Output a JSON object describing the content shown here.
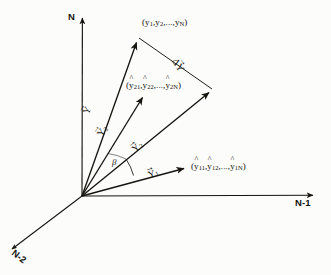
{
  "figure": {
    "kind": "vector-space-geometry-diagram",
    "style": "hand-drawn line art, black ink on off-white paper"
  },
  "axes": [
    {
      "id": "n",
      "label": "N",
      "direction": "vertical-up",
      "tip": [
        82,
        14
      ]
    },
    {
      "id": "n1",
      "label": "N-1",
      "direction": "horizontal-right",
      "tip": [
        318,
        196
      ]
    },
    {
      "id": "n2",
      "label": "N-2",
      "direction": "diagonal-down-left",
      "tip": [
        8,
        252
      ]
    }
  ],
  "origin": {
    "x": 82,
    "y": 196
  },
  "points": [
    {
      "id": "observed",
      "text_main": "(y",
      "parts": [
        {
          "t": "(",
          "sub": ""
        },
        {
          "t": "y",
          "sub": "1"
        },
        {
          "t": ", y",
          "sub": "2"
        },
        {
          "t": ",..., y",
          "sub": "N"
        },
        {
          "t": ")",
          "sub": ""
        }
      ],
      "label": "(y1, y2,..., yN)",
      "x": 138,
      "y": 37
    },
    {
      "id": "fitted2",
      "label": "(y21, y22,..., y2N)",
      "x": 145,
      "y": 92
    },
    {
      "id": "fitted1",
      "label": "(y11, y12,..., y1N)",
      "x": 190,
      "y": 167
    }
  ],
  "labels": {
    "point_observed": {
      "open": "(",
      "y1": "y",
      "y1_sub": "1",
      "y2": "y",
      "y2_sub": "2",
      "yn": "y",
      "yn_sub": "N",
      "sep": ",",
      "ellipsis": ",...,",
      "close": ")"
    },
    "point_fitted2": {
      "open": "(",
      "a": "y",
      "a_sub": "21",
      "b": "y",
      "b_sub": "22",
      "c": "y",
      "c_sub": "2N",
      "sep": ",",
      "ellipsis": ",...,",
      "close": ")"
    },
    "point_fitted1": {
      "open": "(",
      "a": "y",
      "a_sub": "11",
      "b": "y",
      "b_sub": "12",
      "c": "y",
      "c_sub": "1N",
      "sep": ",",
      "ellipsis": ",...,",
      "close": ")"
    },
    "axis_n": "N",
    "axis_n1": "N-1",
    "axis_n2": "N-2",
    "angle_beta": "β"
  },
  "vectors": [
    {
      "id": "Y",
      "symbol": "Y",
      "accent": "arrow",
      "accent_glyph": "→",
      "from": [
        82,
        196
      ],
      "to": [
        138,
        37
      ],
      "label_at": [
        93,
        103
      ],
      "description": "vector to observed response point"
    },
    {
      "id": "Yhat2",
      "symbol": "Y",
      "accent": "hat-arrow",
      "accent_glyph": "→",
      "subscript": "2",
      "from": [
        82,
        196
      ],
      "to": [
        145,
        92
      ],
      "label_at": [
        106,
        124
      ],
      "description": "vector to second fitted point"
    },
    {
      "id": "Yhat2b",
      "symbol": "Y",
      "accent": "hat-arrow",
      "accent_glyph": "→",
      "subscript": "2",
      "from": [
        82,
        196
      ],
      "to": [
        213,
        89
      ],
      "label_at": [
        140,
        140
      ],
      "description": "long vector to parallelogram corner"
    },
    {
      "id": "Yhat1",
      "symbol": "Y",
      "accent": "hat-arrow",
      "accent_glyph": "→",
      "subscript": "1",
      "from": [
        82,
        196
      ],
      "to": [
        190,
        167
      ],
      "label_at": [
        152,
        166
      ],
      "description": "vector to first fitted point"
    },
    {
      "id": "DeltaY",
      "symbol": "ΔY",
      "accent": "arrow",
      "accent_glyph": "→",
      "from": [
        138,
        37
      ],
      "to": [
        213,
        89
      ],
      "label_at": [
        173,
        70
      ],
      "description": "residual / difference segment"
    }
  ],
  "angle": {
    "label": "β",
    "vertex": [
      82,
      196
    ],
    "between": [
      "Yhat2",
      "Yhat1"
    ],
    "label_at": [
      113,
      162
    ]
  },
  "colors": {
    "ink": "#16140f",
    "paper": "#fcfcfa",
    "faint": "#6a665c"
  }
}
